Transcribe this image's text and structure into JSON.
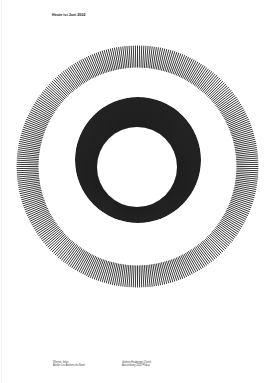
{
  "poster": {
    "title": "Heute ist Juni 2002",
    "colors": {
      "background": "#ffffff",
      "ink": "#111111"
    },
    "artwork": {
      "outer_ring": {
        "cx": 137.5,
        "cy": 166.5,
        "r_outer": 121,
        "r_inner": 99,
        "style": "radial-hairlines"
      },
      "inner_ring": {
        "outer_cx": 138,
        "outer_cy": 160,
        "outer_r": 63,
        "hole_cx": 137,
        "hole_cy": 167,
        "hole_r": 40,
        "style": "dense-hairlines"
      }
    },
    "footer": {
      "left": {
        "line1": "Werner Jeker",
        "line2": "Atelier Les Ateliers du Nord"
      },
      "right": {
        "line1": "Galerie Heuberger Zürich",
        "line2": "Ausstellung 2002 Plakat"
      }
    }
  }
}
